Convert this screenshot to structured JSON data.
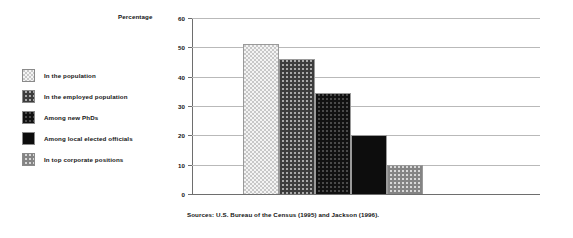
{
  "figure": {
    "source_note": "Sources: U.S. Bureau of the Census (1995) and Jackson (1996)."
  },
  "legend": {
    "items": [
      {
        "label": "In the population",
        "pattern": "light-dither",
        "color": "#e8e8e8"
      },
      {
        "label": "In the employed population",
        "pattern": "medium-dither",
        "color": "#6f6f6f"
      },
      {
        "label": "Among new PhDs",
        "pattern": "dark-dither",
        "color": "#2d2d2d"
      },
      {
        "label": "Among local elected officials",
        "pattern": "solid-black",
        "color": "#0d0d0d"
      },
      {
        "label": "In top corporate positions",
        "pattern": "mid-light-dither",
        "color": "#b4b4b4"
      }
    ]
  },
  "chart_data": {
    "type": "bar",
    "title": "",
    "xlabel": "",
    "ylabel": "Percentage",
    "ylim": [
      0,
      60
    ],
    "yticks": [
      0,
      10,
      20,
      30,
      40,
      50,
      60
    ],
    "ytick_labels": [
      "0",
      "10",
      "20",
      "30",
      "40",
      "50",
      "60"
    ],
    "grid": true,
    "legend_position": "left",
    "categories": [
      "In the population",
      "In the employed population",
      "Among new PhDs",
      "Among local elected officials",
      "In top corporate positions"
    ],
    "values": [
      51,
      46,
      34.5,
      20,
      10
    ]
  }
}
